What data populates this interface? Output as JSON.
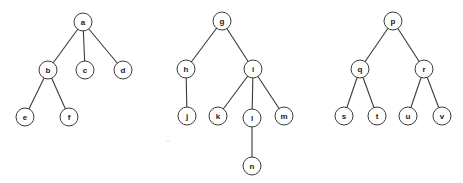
{
  "diagram": {
    "type": "forest",
    "node_radius": 9,
    "colors": {
      "stroke": "#3a3a3a",
      "fill": "#ffffff",
      "label": "#222222"
    },
    "trees": [
      {
        "root": "a",
        "nodes": [
          {
            "id": "a",
            "label": "a",
            "x": 83,
            "y": 22
          },
          {
            "id": "b",
            "label": "b",
            "x": 48,
            "y": 70
          },
          {
            "id": "c",
            "label": "c",
            "x": 85,
            "y": 70
          },
          {
            "id": "d",
            "label": "d",
            "x": 123,
            "y": 70
          },
          {
            "id": "e",
            "label": "e",
            "x": 25,
            "y": 117
          },
          {
            "id": "f",
            "label": "f",
            "x": 69,
            "y": 117
          }
        ],
        "edges": [
          [
            "a",
            "b"
          ],
          [
            "a",
            "c"
          ],
          [
            "a",
            "d"
          ],
          [
            "b",
            "e"
          ],
          [
            "b",
            "f"
          ]
        ]
      },
      {
        "root": "g",
        "nodes": [
          {
            "id": "g",
            "label": "g",
            "x": 222,
            "y": 21
          },
          {
            "id": "h",
            "label": "h",
            "x": 186,
            "y": 69
          },
          {
            "id": "i",
            "label": "i",
            "x": 253,
            "y": 69
          },
          {
            "id": "j",
            "label": "j",
            "x": 187,
            "y": 116
          },
          {
            "id": "k",
            "label": "k",
            "x": 218,
            "y": 116
          },
          {
            "id": "l",
            "label": "l",
            "x": 252,
            "y": 118
          },
          {
            "id": "m",
            "label": "m",
            "x": 284,
            "y": 116
          },
          {
            "id": "n",
            "label": "n",
            "x": 252,
            "y": 166
          }
        ],
        "edges": [
          [
            "g",
            "h"
          ],
          [
            "g",
            "i"
          ],
          [
            "h",
            "j"
          ],
          [
            "i",
            "k"
          ],
          [
            "i",
            "l"
          ],
          [
            "i",
            "m"
          ],
          [
            "l",
            "n"
          ]
        ]
      },
      {
        "root": "p",
        "nodes": [
          {
            "id": "p",
            "label": "p",
            "x": 393,
            "y": 21
          },
          {
            "id": "q",
            "label": "q",
            "x": 360,
            "y": 69
          },
          {
            "id": "r",
            "label": "r",
            "x": 424,
            "y": 69
          },
          {
            "id": "s",
            "label": "s",
            "x": 344,
            "y": 116
          },
          {
            "id": "t",
            "label": "t",
            "x": 377,
            "y": 116
          },
          {
            "id": "u",
            "label": "u",
            "x": 408,
            "y": 116
          },
          {
            "id": "v",
            "label": "v",
            "x": 442,
            "y": 116
          }
        ],
        "edges": [
          [
            "p",
            "q"
          ],
          [
            "p",
            "r"
          ],
          [
            "q",
            "s"
          ],
          [
            "q",
            "t"
          ],
          [
            "r",
            "u"
          ],
          [
            "r",
            "v"
          ]
        ]
      }
    ]
  }
}
